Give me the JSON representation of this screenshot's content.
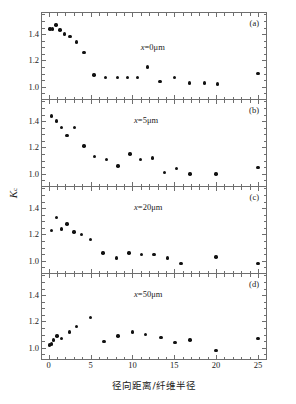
{
  "figure": {
    "xaxis_title": "径向距离/纤维半径",
    "yaxis_label_base": "K",
    "yaxis_label_sub": "c"
  },
  "chart_data": {
    "type": "scatter",
    "title": "",
    "xlabel": "径向距离/纤维半径",
    "ylabel": "Kc",
    "xlim": [
      -0.8,
      26.2
    ],
    "ylim": [
      0.9,
      1.56
    ],
    "xticks": [
      0,
      5,
      10,
      15,
      20,
      25
    ],
    "yticks": [
      1.0,
      1.2,
      1.4
    ],
    "xtick_labels": [
      "0",
      "5",
      "10",
      "15",
      "20",
      "25"
    ],
    "ytick_labels": [
      "1.0",
      "1.2",
      "1.4"
    ],
    "grid": false,
    "legend": "none",
    "marker": "filled-circle",
    "marker_color": "#111111",
    "layout": "4 stacked panels sharing x axis",
    "panels": [
      {
        "tag": "(a)",
        "annotation": "x=0μm",
        "annotation_x": 11.0,
        "annotation_y": 1.3,
        "x": [
          0.15,
          0.45,
          0.85,
          1.35,
          1.9,
          2.55,
          3.3,
          4.2,
          5.4,
          6.8,
          8.2,
          9.4,
          10.6,
          11.8,
          13.3,
          15.0,
          16.8,
          18.6,
          20.2,
          25.0
        ],
        "y": [
          1.44,
          1.44,
          1.47,
          1.43,
          1.4,
          1.38,
          1.34,
          1.26,
          1.09,
          1.07,
          1.07,
          1.07,
          1.07,
          1.15,
          1.04,
          1.07,
          1.03,
          1.03,
          1.02,
          1.1
        ]
      },
      {
        "tag": "(b)",
        "annotation": "x=5μm",
        "annotation_x": 10.2,
        "annotation_y": 1.41,
        "x": [
          0.3,
          0.9,
          1.5,
          2.2,
          3.1,
          4.2,
          5.5,
          6.9,
          8.3,
          9.7,
          11.0,
          12.4,
          13.8,
          15.3,
          16.9,
          20.0,
          25.0
        ],
        "y": [
          1.44,
          1.4,
          1.35,
          1.29,
          1.35,
          1.21,
          1.13,
          1.11,
          1.06,
          1.15,
          1.11,
          1.12,
          1.01,
          1.04,
          1.0,
          1.0,
          1.05
        ]
      },
      {
        "tag": "(c)",
        "annotation": "x=20μm",
        "annotation_x": 10.2,
        "annotation_y": 1.41,
        "x": [
          0.3,
          0.9,
          1.5,
          2.2,
          3.0,
          3.9,
          5.0,
          6.5,
          8.1,
          9.6,
          11.1,
          12.6,
          14.2,
          15.8,
          20.0,
          25.0
        ],
        "y": [
          1.23,
          1.33,
          1.24,
          1.28,
          1.22,
          1.2,
          1.16,
          1.06,
          1.02,
          1.06,
          1.05,
          1.05,
          1.02,
          0.98,
          1.03,
          0.98
        ]
      },
      {
        "tag": "(d)",
        "annotation": "x=50μm",
        "annotation_x": 10.2,
        "annotation_y": 1.41,
        "x": [
          0.1,
          0.3,
          0.6,
          1.0,
          1.5,
          2.5,
          3.3,
          5.0,
          6.6,
          8.3,
          10.0,
          11.6,
          13.4,
          15.1,
          16.9,
          20.0,
          25.0
        ],
        "y": [
          1.02,
          1.03,
          1.06,
          1.09,
          1.07,
          1.12,
          1.16,
          1.23,
          1.05,
          1.09,
          1.12,
          1.1,
          1.08,
          1.04,
          1.06,
          0.98,
          1.07
        ]
      }
    ]
  }
}
